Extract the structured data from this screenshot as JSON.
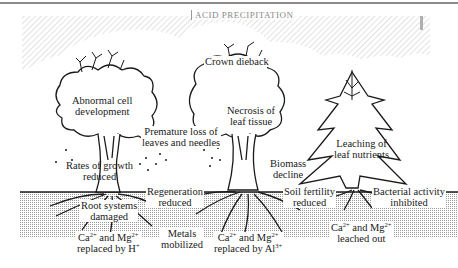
{
  "diagram": {
    "title": "ACID PRECIPITATION",
    "colors": {
      "sky_hatch": "#d9d9d9",
      "soil_fill": "#e4e4e4",
      "ink": "#1a1a1a",
      "background": "#ffffff"
    },
    "trees": [
      {
        "type": "deciduous",
        "labels": {
          "canopy": [
            "Abnormal cell",
            "development"
          ],
          "trunk": [
            "Rates of growth",
            "reduced"
          ],
          "roots": [
            "Root systems",
            "damaged"
          ],
          "ions": {
            "line1_a": "Ca",
            "line1_a_sup": "2+",
            "line1_b": " and Mg",
            "line1_b_sup": "2+",
            "line2": "replaced by H",
            "line2_sup": "+"
          }
        }
      },
      {
        "type": "deciduous",
        "labels": {
          "crown": "Crown dieback",
          "canopy": [
            "Necrosis of",
            "leaf tissue"
          ],
          "trunk": [
            "Biomass",
            "decline"
          ],
          "ions": {
            "line1_a": "Ca",
            "line1_a_sup": "2+",
            "line1_b": " and Mg",
            "line1_b_sup": "2+",
            "line2": "replaced by Al",
            "line2_sup": "3+"
          }
        }
      },
      {
        "type": "conifer",
        "labels": {
          "canopy": [
            "Leaching of",
            "leaf nutrients"
          ],
          "ions": {
            "line1_a": "Ca",
            "line1_a_sup": "2+",
            "line1_b": " and Mg",
            "line1_b_sup": "2+",
            "line2": "leached out"
          }
        }
      }
    ],
    "between_labels": {
      "premature_loss": [
        "Premature loss of",
        "leaves and needles"
      ],
      "regeneration": [
        "Regeneration",
        "reduced"
      ],
      "metals": [
        "Metals",
        "mobilized"
      ],
      "soil_fertility": [
        "Soil fertility",
        "reduced"
      ],
      "bacterial": [
        "Bacterial activity",
        "inhibited"
      ]
    }
  }
}
